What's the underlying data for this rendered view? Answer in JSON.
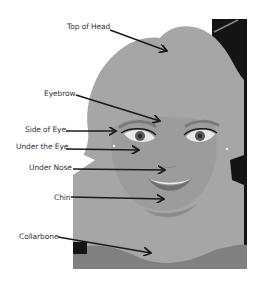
{
  "diagram": {
    "colors": {
      "background": "#ffffff",
      "hair": "#a6a6a6",
      "face": "#9a9a9a",
      "shadow": "#7f7f7f",
      "dark": "#141414",
      "arrow": "#1a1a1a",
      "text": "#333333"
    },
    "labels": [
      {
        "id": "top-of-head",
        "text": "Top of Head"
      },
      {
        "id": "eyebrow",
        "text": "Eyebrow"
      },
      {
        "id": "side-of-eye",
        "text": "Side of Eye"
      },
      {
        "id": "under-the-eye",
        "text": "Under the Eye"
      },
      {
        "id": "under-nose",
        "text": "Under Nose"
      },
      {
        "id": "chin",
        "text": "Chin"
      },
      {
        "id": "collarbone",
        "text": "Collarbone"
      }
    ]
  }
}
